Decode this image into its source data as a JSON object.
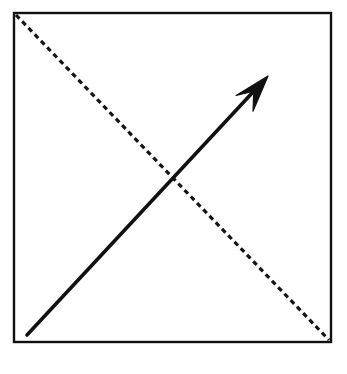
{
  "figure": {
    "title": "",
    "background_color": "#ffffff",
    "ink_color": "#111111",
    "width": 347,
    "height": 374,
    "frame": {
      "name": "square-frame",
      "x": 14,
      "y": 13,
      "width": 317,
      "height": 329,
      "stroke_color": "#111111",
      "stroke_width": 2.4,
      "fill": "none"
    },
    "dashed_diagonal": {
      "name": "dashed-diagonal-line",
      "x1": 16,
      "y1": 15,
      "x2": 329,
      "y2": 340,
      "stroke_color": "#141414",
      "stroke_width": 3.2,
      "dash_length": 5,
      "gap_length": 4,
      "direction": "top-left-to-bottom-right"
    },
    "arrow": {
      "name": "solid-arrow",
      "tail_x": 27,
      "tail_y": 335,
      "tip_x": 268,
      "tip_y": 76,
      "stroke_color": "#111111",
      "stroke_width": 3.6,
      "direction": "bottom-left-to-top-right",
      "head_style": "swept-back-barbed",
      "head_length": 36,
      "head_half_width": 13
    },
    "crossing_point": {
      "name": "intersection-point",
      "x": 173,
      "y": 180
    },
    "scan_artifact": {
      "name": "scan-smudge",
      "visible": true
    }
  }
}
